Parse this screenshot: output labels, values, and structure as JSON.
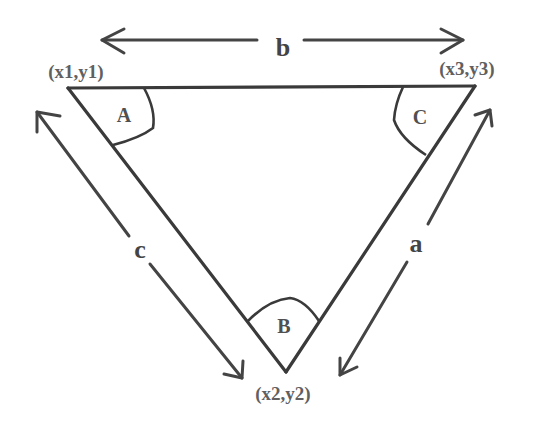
{
  "diagram": {
    "type": "triangle-side-angle-labels",
    "vertices": [
      {
        "label": "(x1,y1)",
        "angle": "A"
      },
      {
        "label": "(x2,y2)",
        "angle": "B"
      },
      {
        "label": "(x3,y3)",
        "angle": "C"
      }
    ],
    "sides": [
      {
        "label": "a",
        "between": "(x2,y2)-(x3,y3)"
      },
      {
        "label": "b",
        "between": "(x1,y1)-(x3,y3)"
      },
      {
        "label": "c",
        "between": "(x1,y1)-(x2,y2)"
      }
    ],
    "colors": {
      "stroke": "#3a3a3a",
      "text": "#555555",
      "background": "#ffffff"
    }
  }
}
